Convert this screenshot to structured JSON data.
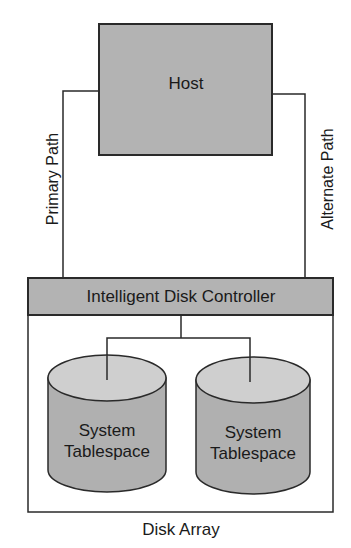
{
  "diagram": {
    "host": {
      "label": "Host"
    },
    "paths": {
      "primary": {
        "label": "Primary Path"
      },
      "alternate": {
        "label": "Alternate Path"
      }
    },
    "controller": {
      "label": "Intelligent Disk Controller"
    },
    "disks": [
      {
        "line1": "System",
        "line2": "Tablespace"
      },
      {
        "line1": "System",
        "line2": "Tablespace"
      }
    ],
    "array": {
      "label": "Disk Array"
    },
    "colors": {
      "box_fill": "#b3b3b3",
      "disk_side": "#b0b0b0",
      "disk_top": "#cfcfcf",
      "stroke": "#2a2a2a"
    }
  }
}
